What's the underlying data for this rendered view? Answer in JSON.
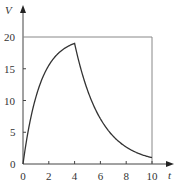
{
  "chart_data": {
    "type": "line",
    "title": "",
    "xlabel": "t",
    "ylabel": "V",
    "xlim": [
      0,
      10
    ],
    "ylim": [
      0,
      20
    ],
    "x_ticks": [
      "0",
      "2",
      "4",
      "6",
      "8",
      "10"
    ],
    "y_ticks": [
      "0",
      "5",
      "10",
      "15",
      "20"
    ],
    "grid": false,
    "legend": null,
    "series": [
      {
        "name": "V(t)",
        "x": [
          0,
          0.5,
          1,
          1.5,
          2,
          2.5,
          3,
          3.5,
          4,
          4.5,
          5,
          5.5,
          6,
          6.5,
          7,
          7.5,
          8,
          8.5,
          9,
          9.5,
          10
        ],
        "values": [
          0,
          6.3,
          10.5,
          13.5,
          15.5,
          16.9,
          17.9,
          18.5,
          19.0,
          14.8,
          11.6,
          9.0,
          7.1,
          5.5,
          4.3,
          3.4,
          2.6,
          2.1,
          1.6,
          1.3,
          1.0
        ]
      }
    ],
    "annotations": [
      {
        "type": "horizontal_line",
        "y": 20,
        "x_range": [
          0,
          10
        ]
      },
      {
        "type": "vertical_line",
        "x": 10,
        "y_range": [
          0,
          20
        ]
      }
    ]
  },
  "labels": {
    "x_axis": "t",
    "y_axis": "V"
  }
}
